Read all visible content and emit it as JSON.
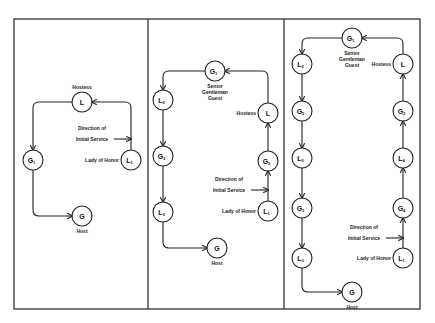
{
  "diagrams": [
    {
      "name": "four-guests",
      "nodes": [
        {
          "id": "hostess",
          "letter": "L",
          "sub": "",
          "x": 82,
          "y": 102,
          "label": "Hostess",
          "label_pos": "above"
        },
        {
          "id": "g1",
          "letter": "G",
          "sub": "1",
          "x": 33,
          "y": 160,
          "label": "",
          "label_pos": ""
        },
        {
          "id": "l1",
          "letter": "L",
          "sub": "1",
          "x": 131,
          "y": 160,
          "label": "Lady of Honor",
          "label_pos": "left"
        },
        {
          "id": "host",
          "letter": "G",
          "sub": "",
          "x": 82,
          "y": 216,
          "label": "Host",
          "label_pos": "below"
        }
      ],
      "direction_label": [
        "Direction of",
        "Initial Service"
      ]
    },
    {
      "name": "six-guests",
      "nodes": [
        {
          "id": "g1",
          "letter": "G",
          "sub": "1",
          "x": 215,
          "y": 71,
          "label": "Senior|Gentleman|Guest",
          "label_pos": "below"
        },
        {
          "id": "l2",
          "letter": "L",
          "sub": "2",
          "x": 163,
          "y": 100,
          "label": "",
          "label_pos": ""
        },
        {
          "id": "g3",
          "letter": "G",
          "sub": "3",
          "x": 163,
          "y": 156,
          "label": "",
          "label_pos": ""
        },
        {
          "id": "l3",
          "letter": "L",
          "sub": "3",
          "x": 163,
          "y": 212,
          "label": "",
          "label_pos": ""
        },
        {
          "id": "host",
          "letter": "G",
          "sub": "",
          "x": 217,
          "y": 248,
          "label": "Host",
          "label_pos": "below"
        },
        {
          "id": "hostess",
          "letter": "L",
          "sub": "",
          "x": 268,
          "y": 113,
          "label": "Hostess",
          "label_pos": "left"
        },
        {
          "id": "g2",
          "letter": "G",
          "sub": "2",
          "x": 268,
          "y": 161,
          "label": "",
          "label_pos": ""
        },
        {
          "id": "l1",
          "letter": "L",
          "sub": "1",
          "x": 268,
          "y": 211,
          "label": "Lady of Honor",
          "label_pos": "left"
        }
      ],
      "direction_label": [
        "Direction of",
        "Initial Service"
      ]
    },
    {
      "name": "ten-guests",
      "nodes": [
        {
          "id": "g1",
          "letter": "G",
          "sub": "1",
          "x": 352,
          "y": 38,
          "label": "Senior|Gentleman|Guest",
          "label_pos": "below"
        },
        {
          "id": "l2",
          "letter": "L",
          "sub": "2",
          "x": 302,
          "y": 64,
          "label": "",
          "label_pos": ""
        },
        {
          "id": "g5",
          "letter": "G",
          "sub": "5",
          "x": 302,
          "y": 111,
          "label": "",
          "label_pos": ""
        },
        {
          "id": "l5",
          "letter": "L",
          "sub": "5",
          "x": 302,
          "y": 158,
          "label": "",
          "label_pos": ""
        },
        {
          "id": "g3",
          "letter": "G",
          "sub": "3",
          "x": 302,
          "y": 208,
          "label": "",
          "label_pos": ""
        },
        {
          "id": "l3",
          "letter": "L",
          "sub": "3",
          "x": 302,
          "y": 258,
          "label": "",
          "label_pos": ""
        },
        {
          "id": "host",
          "letter": "G",
          "sub": "",
          "x": 352,
          "y": 292,
          "label": "Host",
          "label_pos": "below"
        },
        {
          "id": "hostess",
          "letter": "L",
          "sub": "",
          "x": 403,
          "y": 64,
          "label": "Hostess",
          "label_pos": "left"
        },
        {
          "id": "g2",
          "letter": "G",
          "sub": "2",
          "x": 403,
          "y": 111,
          "label": "",
          "label_pos": ""
        },
        {
          "id": "l4",
          "letter": "L",
          "sub": "4",
          "x": 403,
          "y": 158,
          "label": "",
          "label_pos": ""
        },
        {
          "id": "g4",
          "letter": "G",
          "sub": "4",
          "x": 403,
          "y": 208,
          "label": "",
          "label_pos": ""
        },
        {
          "id": "l1",
          "letter": "L",
          "sub": "1",
          "x": 403,
          "y": 258,
          "label": "Lady of Honor",
          "label_pos": "left"
        }
      ],
      "direction_label": [
        "Direction of",
        "Initial Service"
      ]
    }
  ]
}
